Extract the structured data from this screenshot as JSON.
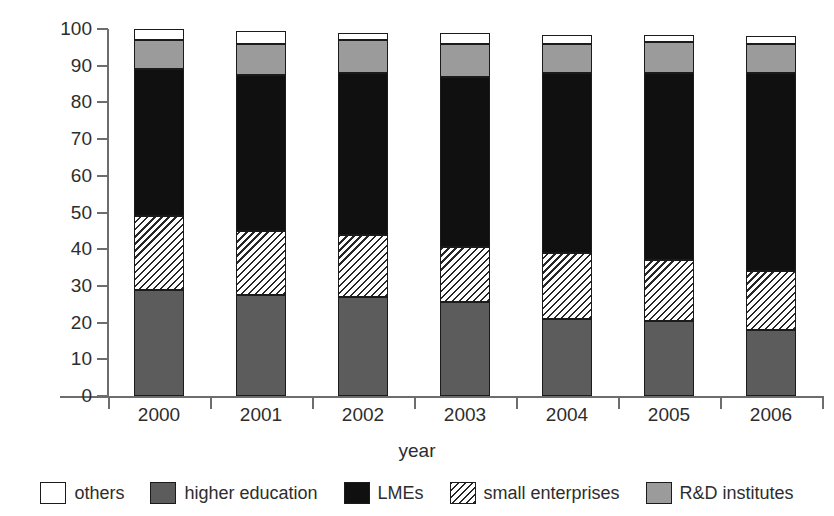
{
  "chart_data": {
    "type": "bar",
    "variant": "stacked-vertical-100percent",
    "title": "",
    "xlabel": "year",
    "ylabel": "R&D expenditure (%)",
    "ylim": [
      0,
      100
    ],
    "yticks": [
      0,
      10,
      20,
      30,
      40,
      50,
      60,
      70,
      80,
      90,
      100
    ],
    "ytick_labels": [
      "0",
      "10",
      "20",
      "30",
      "40",
      "50",
      "60",
      "70",
      "80",
      "90",
      "100"
    ],
    "grid": false,
    "legend_position": "bottom",
    "categories": [
      "2000",
      "2001",
      "2002",
      "2003",
      "2004",
      "2005",
      "2006"
    ],
    "stack_order_bottom_to_top": [
      "higher education",
      "small enterprises",
      "LMEs",
      "R&D institutes",
      "others"
    ],
    "series": [
      {
        "name": "higher education",
        "color": "#5c5c5c",
        "fill": "solid-dark-gray",
        "values": [
          29,
          27.5,
          27,
          25.5,
          21,
          20.5,
          18
        ]
      },
      {
        "name": "small enterprises",
        "color": "#ffffff",
        "fill": "diagonal-hatch",
        "values": [
          20,
          17.5,
          17,
          15,
          18,
          16.5,
          16
        ]
      },
      {
        "name": "LMEs",
        "color": "#101010",
        "fill": "solid-black",
        "values": [
          40,
          42.5,
          44,
          46.5,
          49,
          51,
          54
        ]
      },
      {
        "name": "R&D institutes",
        "color": "#9b9b9b",
        "fill": "solid-light-gray",
        "values": [
          8,
          8.5,
          9,
          9,
          8,
          8.5,
          8
        ]
      },
      {
        "name": "others",
        "color": "#ffffff",
        "fill": "solid-white",
        "values": [
          3,
          3.5,
          2,
          3,
          2.5,
          2,
          2
        ]
      }
    ],
    "cumulative_tops": {
      "higher education": [
        29,
        27.5,
        27,
        25.5,
        21,
        20.5,
        18
      ],
      "small enterprises": [
        49,
        45,
        44,
        40.5,
        39,
        37,
        34
      ],
      "LMEs": [
        89,
        87.5,
        88,
        87,
        88,
        88,
        88
      ],
      "R&D institutes": [
        97,
        96,
        97,
        96,
        96,
        96.5,
        96
      ],
      "others": [
        100,
        99.5,
        99,
        99,
        98.5,
        98.5,
        98
      ]
    }
  },
  "legend": {
    "items": [
      {
        "label": "others",
        "swatch": "white-square-swatch"
      },
      {
        "label": "higher education",
        "swatch": "dark-gray-square-swatch"
      },
      {
        "label": "LMEs",
        "swatch": "black-square-swatch"
      },
      {
        "label": "small enterprises",
        "swatch": "hatched-square-swatch"
      },
      {
        "label": "R&D institutes",
        "swatch": "light-gray-square-swatch"
      }
    ]
  }
}
